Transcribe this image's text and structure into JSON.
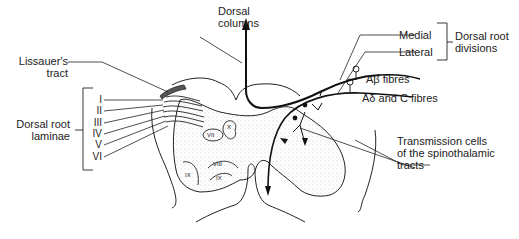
{
  "labels": {
    "dorsal_columns": [
      "Dorsal",
      "columns"
    ],
    "lissauers_tract": [
      "Lissauer's",
      "tract"
    ],
    "dorsal_root_laminae": [
      "Dorsal root",
      "laminae"
    ],
    "laminae": [
      "I",
      "II",
      "III",
      "IV",
      "V",
      "VI"
    ],
    "medial": "Medial",
    "lateral": "Lateral",
    "dorsal_root_divisions": [
      "Dorsal root",
      "divisions"
    ],
    "a_beta_fibres": "Aβ fibres",
    "a_delta_c_fibres": "Aδ and C fibres",
    "transmission_cells": [
      "Transmission cells",
      "of the spinothalamic",
      "tracts"
    ],
    "inner_laminae": [
      "VII",
      "X",
      "VIII",
      "IX",
      "IX"
    ]
  },
  "colors": {
    "ink": "#222222",
    "background": "#ffffff",
    "stipple": "#9a9a9a"
  }
}
